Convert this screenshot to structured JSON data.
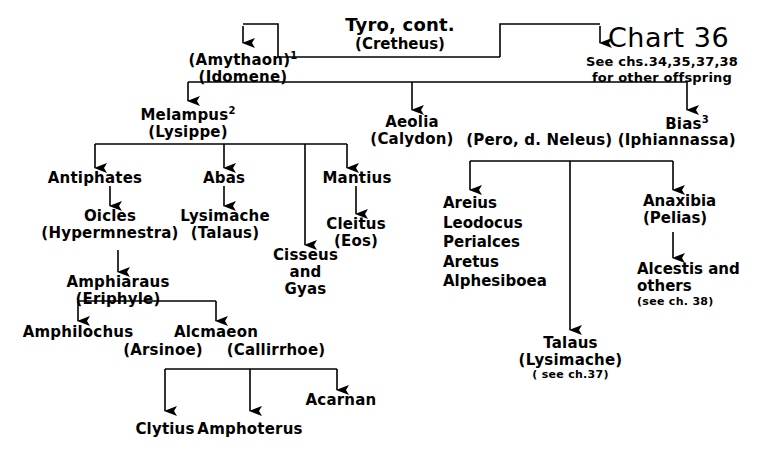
{
  "chart": {
    "id_label": "Chart 36",
    "title": "Tyro, cont.",
    "title_consort": "(Cretheus)",
    "cross_ref_line1": "See chs.34,35,37,38",
    "cross_ref_line2": "for other offspring"
  },
  "nodes": {
    "amythaon": {
      "name": "(Amythaon)",
      "sup": "1",
      "consort": "(Idomene)"
    },
    "melampus": {
      "name": "Melampus",
      "sup": "2",
      "consort": "(Lysippe)"
    },
    "aeolia": {
      "name": "Aeolia",
      "consort": "(Calydon)"
    },
    "bias": {
      "name": "Bias",
      "sup": "3",
      "consort": "(Pero, d. Neleus) (Iphiannassa)"
    },
    "antiphates": {
      "name": "Antiphates"
    },
    "abas": {
      "name": "Abas"
    },
    "mantius": {
      "name": "Mantius"
    },
    "cisseus": {
      "name": "Cisseus",
      "line2": "and",
      "line3": "Gyas"
    },
    "oicles": {
      "name": "Oicles",
      "consort": "(Hypermnestra)"
    },
    "lysimache": {
      "name": "Lysimache",
      "consort": "(Talaus)"
    },
    "cleitus": {
      "name": "Cleitus",
      "consort": "(Eos)"
    },
    "amphiaraus": {
      "name": "Amphiaraus",
      "consort": "(Eriphyle)"
    },
    "amphilochus": {
      "name": "Amphilochus"
    },
    "alcmaeon": {
      "name": "Alcmaeon",
      "consort_left": "(Arsinoe)",
      "consort_right": "(Callirrhoe)"
    },
    "clytius": {
      "name": "Clytius"
    },
    "amphoterus": {
      "name": "Amphoterus"
    },
    "acarnan": {
      "name": "Acarnan"
    },
    "bias_offspring": {
      "items": [
        "Areius",
        "Leodocus",
        "Perialces",
        "Aretus",
        "Alphesiboea"
      ]
    },
    "talaus": {
      "name": "Talaus",
      "consort": "(Lysimache)",
      "note": "( see ch.37)"
    },
    "anaxibia": {
      "name": "Anaxibia",
      "consort": "(Pelias)"
    },
    "alcestis": {
      "name": "Alcestis and",
      "line2": "others",
      "note": "(see ch. 38)"
    }
  },
  "colors": {
    "ink": "#000000",
    "paper": "#ffffff"
  }
}
